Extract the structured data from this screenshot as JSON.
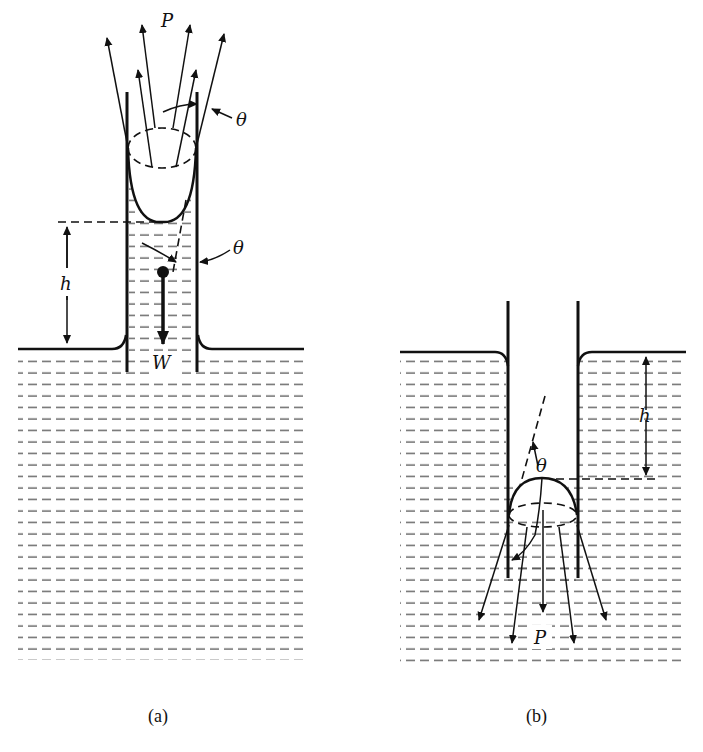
{
  "figure": {
    "panels": [
      {
        "id": "a",
        "caption": "(a)",
        "description": "Capillary rise in a tube with wetting liquid (concave meniscus)",
        "labels": {
          "force": "P",
          "contact_angle_top": "θ",
          "contact_angle_side": "θ",
          "height": "h",
          "weight": "W"
        }
      },
      {
        "id": "b",
        "caption": "(b)",
        "description": "Capillary depression in a tube with non-wetting liquid (convex meniscus)",
        "labels": {
          "force": "P",
          "contact_angle": "θ",
          "height": "h"
        }
      }
    ],
    "colors": {
      "ink": "#111111",
      "liquid_hatch": "#555555",
      "background": "#ffffff"
    }
  }
}
